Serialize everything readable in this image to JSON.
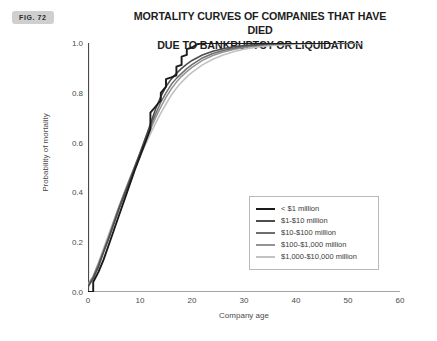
{
  "figure": {
    "badge": "FIG. 72"
  },
  "chart_data": {
    "type": "line",
    "title": "MORTALITY CURVES OF COMPANIES THAT HAVE DIED DUE TO BANKRUPTCY OR LIQUIDATION",
    "title_lines": [
      "MORTALITY CURVES OF COMPANIES THAT HAVE DIED",
      "DUE TO BANKRUPTCY OR LIQUIDATION"
    ],
    "xlabel": "Company age",
    "ylabel": "Probability of mortality",
    "xlim": [
      0,
      60
    ],
    "ylim": [
      0.0,
      1.0
    ],
    "xticks": [
      0,
      10,
      20,
      30,
      40,
      50,
      60
    ],
    "xticklabels": [
      "0",
      "10",
      "20",
      "30",
      "40",
      "50",
      "60"
    ],
    "yticks": [
      0.0,
      0.2,
      0.4,
      0.6,
      0.8,
      1.0
    ],
    "yticklabels": [
      "0.0",
      "0.2",
      "0.4",
      "0.6",
      "0.8",
      "1.0"
    ],
    "grid": false,
    "legend_position": "lower right",
    "series": [
      {
        "name": "< $1 million",
        "color": "#1a1a1a",
        "width": 1.9,
        "x": [
          0,
          1,
          1,
          2,
          3,
          4,
          5,
          6,
          7,
          8,
          9,
          10,
          11,
          12,
          12,
          13,
          14,
          14,
          15,
          15,
          16,
          17,
          17,
          18,
          18,
          19,
          19,
          20,
          21,
          22,
          30,
          40,
          47
        ],
        "y": [
          0.0,
          0.0,
          0.04,
          0.08,
          0.13,
          0.19,
          0.25,
          0.31,
          0.37,
          0.43,
          0.49,
          0.545,
          0.6,
          0.655,
          0.72,
          0.745,
          0.77,
          0.8,
          0.825,
          0.855,
          0.862,
          0.87,
          0.905,
          0.912,
          0.945,
          0.952,
          0.975,
          0.982,
          0.995,
          1.0,
          1.0,
          1.0,
          1.0
        ]
      },
      {
        "name": "$1-$10 million",
        "color": "#4d4d4d",
        "width": 1.6,
        "x": [
          0,
          1,
          2,
          3,
          4,
          5,
          6,
          7,
          8,
          9,
          10,
          11,
          12,
          13,
          14,
          15,
          16,
          17,
          18,
          19,
          20,
          22,
          24,
          26,
          28,
          30,
          34,
          40,
          46,
          50
        ],
        "y": [
          0.02,
          0.055,
          0.1,
          0.16,
          0.215,
          0.275,
          0.335,
          0.39,
          0.445,
          0.5,
          0.555,
          0.615,
          0.675,
          0.735,
          0.785,
          0.825,
          0.855,
          0.878,
          0.898,
          0.915,
          0.93,
          0.952,
          0.967,
          0.977,
          0.985,
          0.99,
          0.996,
          1.0,
          1.0,
          1.0
        ]
      },
      {
        "name": "$10-$100 million",
        "color": "#6e6e6e",
        "width": 1.5,
        "x": [
          0,
          1,
          2,
          3,
          4,
          5,
          6,
          7,
          8,
          9,
          10,
          11,
          12,
          13,
          14,
          15,
          16,
          17,
          18,
          19,
          20,
          22,
          24,
          26,
          28,
          30,
          34,
          40,
          46,
          51
        ],
        "y": [
          0.025,
          0.06,
          0.108,
          0.165,
          0.22,
          0.28,
          0.34,
          0.395,
          0.45,
          0.505,
          0.56,
          0.615,
          0.665,
          0.715,
          0.762,
          0.8,
          0.833,
          0.858,
          0.878,
          0.897,
          0.913,
          0.94,
          0.958,
          0.97,
          0.979,
          0.986,
          0.994,
          0.999,
          1.0,
          1.0
        ]
      },
      {
        "name": "$100-$1,000 million",
        "color": "#949494",
        "width": 1.5,
        "x": [
          0,
          1,
          2,
          3,
          4,
          5,
          6,
          7,
          8,
          9,
          10,
          11,
          12,
          13,
          14,
          15,
          16,
          17,
          18,
          19,
          20,
          22,
          24,
          26,
          28,
          30,
          34,
          40,
          46,
          52
        ],
        "y": [
          0.028,
          0.062,
          0.112,
          0.168,
          0.225,
          0.285,
          0.345,
          0.4,
          0.455,
          0.505,
          0.555,
          0.605,
          0.653,
          0.7,
          0.743,
          0.782,
          0.815,
          0.843,
          0.866,
          0.885,
          0.902,
          0.93,
          0.95,
          0.964,
          0.974,
          0.982,
          0.992,
          0.998,
          1.0,
          1.0
        ]
      },
      {
        "name": "$1,000-$10,000 million",
        "color": "#c2c2c2",
        "width": 1.6,
        "x": [
          0,
          1,
          2,
          3,
          4,
          5,
          6,
          7,
          8,
          9,
          10,
          11,
          12,
          13,
          14,
          15,
          16,
          17,
          18,
          19,
          20,
          22,
          24,
          26,
          28,
          30,
          34,
          40,
          46,
          53
        ],
        "y": [
          0.03,
          0.065,
          0.118,
          0.175,
          0.233,
          0.29,
          0.345,
          0.4,
          0.45,
          0.498,
          0.545,
          0.59,
          0.635,
          0.678,
          0.718,
          0.755,
          0.79,
          0.818,
          0.843,
          0.864,
          0.882,
          0.912,
          0.935,
          0.952,
          0.965,
          0.975,
          0.988,
          0.996,
          0.999,
          1.0
        ]
      }
    ]
  }
}
